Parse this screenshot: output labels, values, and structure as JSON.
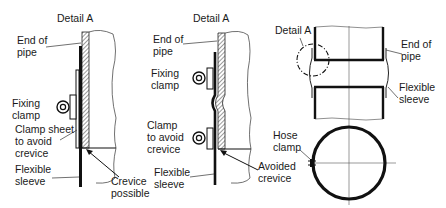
{
  "figure": {
    "panels": [
      {
        "id": "left-detail",
        "title": "Detail A",
        "labels": {
          "end_of_pipe": [
            "End of",
            "pipe"
          ],
          "fixing_clamp": [
            "Fixing",
            "clamp"
          ],
          "clamp_sheet": [
            "Clamp sheet",
            "to avoid",
            "crevice"
          ],
          "flexible_sleeve": [
            "Flexible",
            "sleeve"
          ],
          "crevice": [
            "Crevice",
            "possible"
          ]
        }
      },
      {
        "id": "middle-detail",
        "title": "Detail A",
        "labels": {
          "end_of_pipe": [
            "End of",
            "pipe"
          ],
          "fixing_clamp": [
            "Fixing",
            "clamp"
          ],
          "clamp_avoid": [
            "Clamp",
            "to avoid",
            "crevice"
          ],
          "flexible_sleeve": [
            "Flexible",
            "sleeve"
          ],
          "avoided_crevice": [
            "Avoided",
            "crevice"
          ]
        }
      },
      {
        "id": "right-overview",
        "labels": {
          "detail_a": "Detail A",
          "end_of_pipe": [
            "End of",
            "pipe"
          ],
          "flexible_sleeve": [
            "Flexible",
            "sleeve"
          ],
          "hose_clamp": [
            "Hose",
            "clamp"
          ]
        }
      }
    ]
  }
}
